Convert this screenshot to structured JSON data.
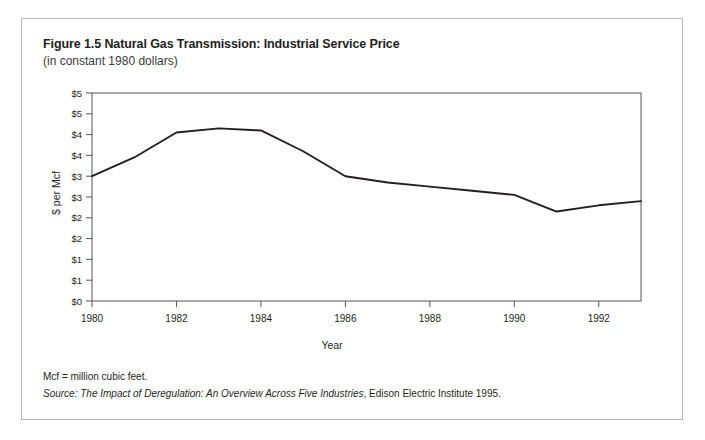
{
  "figure": {
    "title": "Figure 1.5 Natural Gas Transmission: Industrial Service Price",
    "subtitle": "(in constant 1980 dollars)",
    "footnote": "Mcf = million cubic feet.",
    "source_label": "Source:",
    "source_title": "The Impact of Deregulation: An Overview Across Five Industries",
    "source_rest": ", Edison Electric Institute 1995."
  },
  "style": {
    "line_color": "#231f20",
    "axis_color": "#555555",
    "border_color": "#b8b8b8",
    "text_color": "#231f20"
  },
  "chart_data": {
    "type": "line",
    "title": "Figure 1.5 Natural Gas Transmission: Industrial Service Price",
    "subtitle": "(in constant 1980 dollars)",
    "xlabel": "Year",
    "ylabel": "$ per Mcf",
    "xlim": [
      1980,
      1993
    ],
    "ylim": [
      0,
      5
    ],
    "grid": false,
    "legend": "none",
    "x_tick_labels": [
      "1980",
      "1982",
      "1984",
      "1986",
      "1988",
      "1990",
      "1992"
    ],
    "x_tick_values": [
      1980,
      1982,
      1984,
      1986,
      1988,
      1990,
      1992
    ],
    "y_tick_labels": [
      "$0",
      "$1",
      "$1",
      "$2",
      "$2",
      "$3",
      "$3",
      "$4",
      "$4",
      "$5",
      "$5"
    ],
    "y_tick_values": [
      0,
      0.5,
      1,
      1.5,
      2,
      2.5,
      3,
      3.5,
      4,
      4.5,
      5
    ],
    "series": [
      {
        "name": "Industrial Service Price",
        "x": [
          1980,
          1981,
          1982,
          1983,
          1984,
          1985,
          1986,
          1987,
          1988,
          1989,
          1990,
          1991,
          1992,
          1993
        ],
        "values": [
          3.0,
          3.45,
          4.05,
          4.15,
          4.1,
          3.6,
          3.0,
          2.85,
          2.75,
          2.65,
          2.55,
          2.15,
          2.3,
          2.4
        ]
      }
    ]
  }
}
